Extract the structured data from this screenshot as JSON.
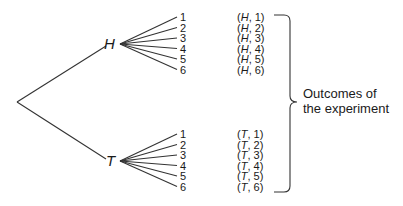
{
  "diagram": {
    "type": "tree",
    "root": {
      "x": 17,
      "y": 102
    },
    "level1": [
      {
        "label": "H",
        "x": 120,
        "y": 44,
        "label_x": 104,
        "label_y": 49
      },
      {
        "label": "T",
        "x": 120,
        "y": 161,
        "label_x": 106,
        "label_y": 166
      }
    ],
    "die_faces": [
      "1",
      "2",
      "3",
      "4",
      "5",
      "6"
    ],
    "h_branch": {
      "leaf_x": 177,
      "label_x": 180,
      "leaf_ys": [
        17,
        27.5,
        38,
        48.5,
        59,
        69.5
      ],
      "outcomes": [
        "(H, 1)",
        "(H, 2)",
        "(H, 3)",
        "(H, 4)",
        "(H, 5)",
        "(H, 6)"
      ]
    },
    "t_branch": {
      "leaf_x": 177,
      "label_x": 180,
      "leaf_ys": [
        134,
        144.5,
        155,
        165.5,
        176,
        186.5
      ],
      "outcomes": [
        "(T, 1)",
        "(T, 2)",
        "(T, 3)",
        "(T, 4)",
        "(T, 5)",
        "(T, 6)"
      ]
    },
    "outcome_x": 237,
    "brace": {
      "x_start": 274,
      "x_line": 290,
      "x_tip": 297,
      "y_top": 15,
      "y_mid": 102,
      "y_bottom": 192
    },
    "annotation": {
      "line1": "Outcomes of",
      "line2": "the experiment"
    },
    "colors": {
      "line": "#333333",
      "text": "#1a1a1a",
      "background": "#ffffff"
    }
  }
}
